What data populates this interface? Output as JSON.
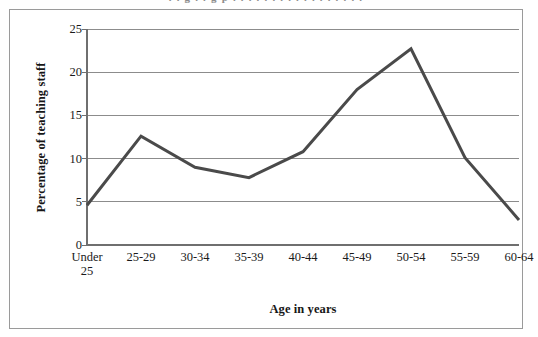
{
  "figure": {
    "title_remnant": "partially cropped title above frame",
    "frame_color": "#9a9a9a",
    "background": "#ffffff"
  },
  "chart_data": {
    "type": "line",
    "title": "",
    "xlabel": "Age in years",
    "ylabel": "Percentage of teaching staff",
    "categories": [
      "Under\n25",
      "25-29",
      "30-34",
      "35-39",
      "40-44",
      "45-49",
      "50-54",
      "55-59",
      "60-64"
    ],
    "values": [
      4.6,
      12.6,
      9.0,
      7.8,
      10.8,
      18.0,
      22.7,
      10.1,
      2.9
    ],
    "ylim": [
      0,
      25
    ],
    "yticks": [
      0,
      5,
      10,
      15,
      20,
      25
    ],
    "ytick_labels": [
      "0",
      "5",
      "10",
      "15",
      "20",
      "25"
    ],
    "grid": true,
    "grid_axis": "y",
    "grid_color": "#8c8c8c",
    "legend": "none",
    "line_color": "#4a4a4a",
    "line_width": 3,
    "markers": "none",
    "axis_color": "#6f6f6f"
  }
}
